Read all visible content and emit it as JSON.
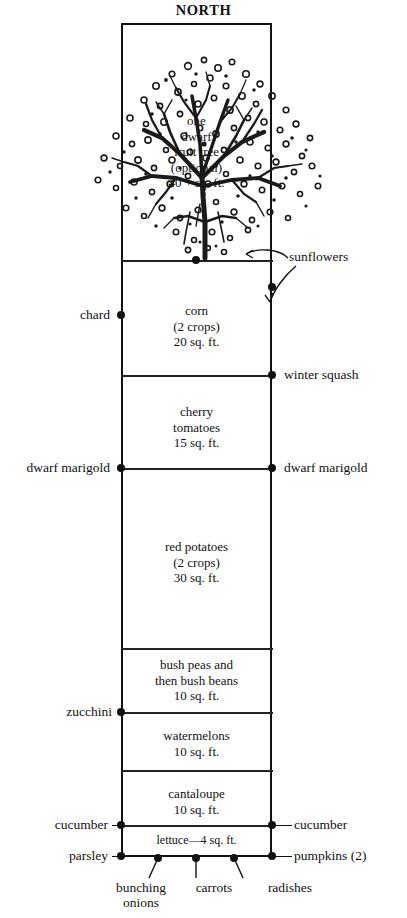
{
  "diagram": {
    "title": "NORTH",
    "type": "garden-bed-plan"
  },
  "tree": {
    "caption_lines": [
      "one",
      "dwarf",
      "fruit tree",
      "(optional)",
      "40 + sq. ft."
    ]
  },
  "beds": [
    {
      "id": "tree-bed",
      "lines": []
    },
    {
      "id": "corn",
      "lines": [
        "corn",
        "(2 crops)",
        "20 sq. ft."
      ]
    },
    {
      "id": "cherry-tomatoes",
      "lines": [
        "cherry",
        "tomatoes",
        "15 sq. ft."
      ]
    },
    {
      "id": "red-potatoes",
      "lines": [
        "red potatoes",
        "(2 crops)",
        "30 sq. ft."
      ]
    },
    {
      "id": "bush-peas-beans",
      "lines": [
        "bush peas and",
        "then bush beans",
        "10 sq. ft."
      ]
    },
    {
      "id": "watermelons",
      "lines": [
        "watermelons",
        "10 sq. ft."
      ]
    },
    {
      "id": "cantaloupe",
      "lines": [
        "cantaloupe",
        "10 sq. ft."
      ]
    },
    {
      "id": "lettuce",
      "lines": [
        "lettuce—4 sq. ft."
      ]
    }
  ],
  "edge_labels": {
    "sunflowers": "sunflowers",
    "chard": "chard",
    "winter_squash": "winter squash",
    "dwarf_marigold_left": "dwarf marigold",
    "dwarf_marigold_right": "dwarf marigold",
    "zucchini": "zucchini",
    "cucumber_left": "cucumber",
    "cucumber_right": "cucumber",
    "parsley": "parsley",
    "pumpkins": "pumpkins (2)"
  },
  "bottom_labels": {
    "bunching_onions_line1": "bunching",
    "bunching_onions_line2": "onions",
    "carrots": "carrots",
    "radishes": "radishes"
  },
  "colors": {
    "ink": "#111111",
    "paper": "#ffffff"
  }
}
